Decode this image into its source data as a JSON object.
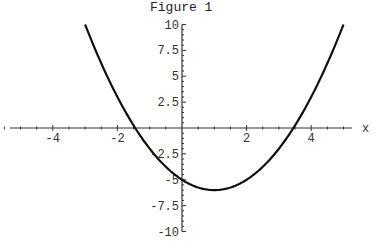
{
  "chart_data": {
    "type": "line",
    "title": "Figure 1",
    "xlabel": "x",
    "ylabel": "",
    "xlim": [
      -5.6,
      5.3
    ],
    "ylim": [
      -10,
      10
    ],
    "grid": false,
    "legend": null,
    "x_ticks": [
      -4,
      -2,
      2,
      4
    ],
    "y_ticks": [
      10,
      7.5,
      5,
      2.5,
      -2.5,
      -5,
      -7.5,
      -10
    ],
    "x_tick_labels": [
      "-4",
      "-2",
      "2",
      "4"
    ],
    "y_tick_labels": [
      "10",
      "7.5",
      "5",
      "2.5",
      "-2.5",
      "-5",
      "-7.5",
      "-10"
    ],
    "series": [
      {
        "name": "x^2 - 2x - 5",
        "domain": [
          -3,
          5
        ],
        "x": [
          -3,
          -2.5,
          -2,
          -1.5,
          -1,
          -0.5,
          0,
          0.5,
          1,
          1.5,
          2,
          2.5,
          3,
          3.5,
          4,
          4.5,
          5
        ],
        "values": [
          10,
          6.25,
          3,
          0.25,
          -2,
          -3.75,
          -5,
          -5.75,
          -6,
          -5.75,
          -5,
          -3.75,
          -2,
          0.25,
          3,
          6.25,
          10
        ]
      }
    ]
  },
  "labels": {
    "title": "Figure 1",
    "x_axis": "x"
  }
}
